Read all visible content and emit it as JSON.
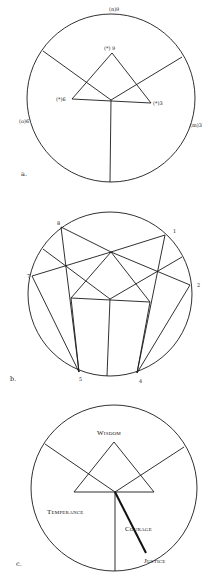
{
  "diagram_a": {
    "caption": "a.",
    "outer_labels": {
      "top": "(n)9",
      "left": "(o)6",
      "right": "(m)3"
    },
    "triangle_labels": {
      "apex": "(*) 9",
      "left": "(*)6",
      "right": "(*)3"
    }
  },
  "diagram_b": {
    "caption": "b.",
    "point_labels": {
      "p1": "1",
      "p2": "2",
      "p4": "4",
      "p5": "5",
      "p7": "7",
      "p8": "8"
    }
  },
  "diagram_c": {
    "caption": "c.",
    "virtues": {
      "wisdom": "Wisdom",
      "temperance": "Temperance",
      "courage": "Courage",
      "justice": "Justice"
    }
  }
}
